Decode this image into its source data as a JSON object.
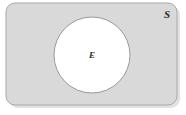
{
  "figure": {
    "type": "venn-diagram",
    "background_color": "#ffffff"
  },
  "sample_space": {
    "label": "S",
    "name": "sample-space",
    "shape": "rounded-rectangle",
    "fill_color": "#d9d9d9",
    "stroke_color": "#a8a8a8",
    "x": 6,
    "y": 3,
    "width": 171,
    "height": 102,
    "corner_radius": 9,
    "label_x": 167,
    "label_y": 18
  },
  "event": {
    "label": "E",
    "name": "event-region",
    "shape": "circle",
    "fill_color": "#ffffff",
    "stroke_color": "#9a9a9a",
    "center_x": 92,
    "center_y": 55,
    "radius": 38,
    "label_x": 92,
    "label_y": 58
  },
  "shadow": {
    "name": "drop-shadow",
    "color": "#e2e2e2",
    "offset_x": 3,
    "offset_y": 3
  }
}
